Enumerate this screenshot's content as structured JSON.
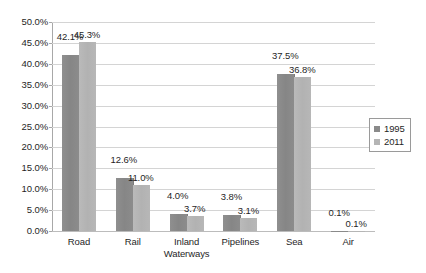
{
  "chart_data": {
    "type": "bar",
    "title": "",
    "subtitle": "",
    "xlabel": "",
    "ylabel": "",
    "categories": [
      "Road",
      "Rail",
      "Inland Waterways",
      "Pipelines",
      "Sea",
      "Air"
    ],
    "series": [
      {
        "name": "1995",
        "color": "#8a8a8a",
        "values": [
          42.1,
          12.6,
          4.0,
          3.8,
          37.5,
          0.1
        ],
        "labels": [
          "42.1%",
          "12.6%",
          "4.0%",
          "3.8%",
          "37.5%",
          "0.1%"
        ]
      },
      {
        "name": "2011",
        "color": "#b5b5b5",
        "values": [
          45.3,
          11.0,
          3.7,
          3.1,
          36.8,
          0.1
        ],
        "labels": [
          "45.3%",
          "11.0%",
          "3.7%",
          "3.1%",
          "36.8%",
          "0.1%"
        ]
      }
    ],
    "ylim": [
      0,
      50
    ],
    "ytick_values": [
      0,
      5,
      10,
      15,
      20,
      25,
      30,
      35,
      40,
      45,
      50
    ],
    "ytick_labels": [
      "0.0%",
      "5.0%",
      "10.0%",
      "15.0%",
      "20.0%",
      "25.0%",
      "30.0%",
      "35.0%",
      "40.0%",
      "45.0%",
      "50.0%"
    ],
    "grid": true,
    "legend_position": "right",
    "value_labels_shown": true
  },
  "legend": {
    "items": [
      {
        "label": "1995",
        "color": "#8a8a8a"
      },
      {
        "label": "2011",
        "color": "#b5b5b5"
      }
    ]
  },
  "axis": {
    "x_categories": [
      "Road",
      "Rail",
      "Inland Waterways",
      "Pipelines",
      "Sea",
      "Air"
    ],
    "y_labels": [
      "50.0%",
      "45.0%",
      "40.0%",
      "35.0%",
      "30.0%",
      "25.0%",
      "20.0%",
      "15.0%",
      "10.0%",
      "5.0%",
      "0.0%"
    ]
  },
  "colors": {
    "series_1995": "#8a8a8a",
    "series_2011": "#b5b5b5",
    "gridline": "#d4d4d4",
    "axis": "#a8a8a8",
    "text": "#1f1f1f",
    "background": "#ffffff"
  }
}
